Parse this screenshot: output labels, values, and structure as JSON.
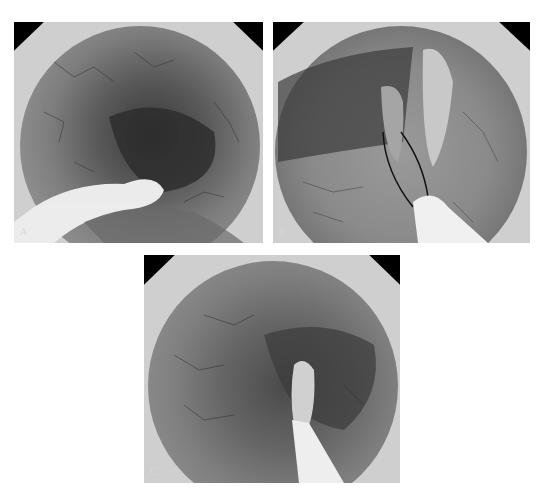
{
  "figure": {
    "panels": [
      {
        "id": "A",
        "label": "A",
        "description": "Endoscopic view of colonic lumen with looped white catheter/stent in lumen"
      },
      {
        "id": "B",
        "label": "B",
        "description": "Endoscopic view showing guide wire and white catheter inserted toward tubular structure"
      },
      {
        "id": "C",
        "label": "C",
        "description": "Endoscopic view with catheter inserted into appendiceal orifice/lumen"
      }
    ]
  }
}
